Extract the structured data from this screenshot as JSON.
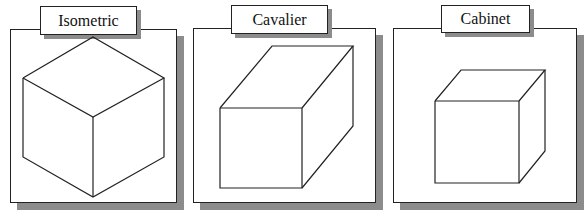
{
  "colors": {
    "shadow": "#8c8c8c",
    "stroke": "#222222",
    "background": "#ffffff"
  },
  "panels": [
    {
      "id": "isometric",
      "label": "Isometric",
      "box": {
        "x": 10,
        "y": 29,
        "w": 167,
        "h": 174
      },
      "labelBox": {
        "x": 40,
        "y": 6,
        "w": 97,
        "h": 29
      },
      "cube_shape": "isometric-cube",
      "vertices": {
        "top": [
          93,
          37
        ],
        "left": [
          23,
          78
        ],
        "right": [
          164,
          78
        ],
        "center": [
          93,
          117
        ],
        "bottom": [
          93,
          197
        ],
        "lower_left": [
          23,
          157
        ],
        "lower_right": [
          164,
          157
        ]
      }
    },
    {
      "id": "cavalier",
      "label": "Cavalier",
      "box": {
        "x": 193,
        "y": 28,
        "w": 183,
        "h": 175
      },
      "labelBox": {
        "x": 231,
        "y": 5,
        "w": 97,
        "h": 29
      },
      "cube_shape": "cavalier-box",
      "vertices": {
        "front_tl": [
          220,
          108
        ],
        "front_tr": [
          302,
          108
        ],
        "front_br": [
          302,
          188
        ],
        "front_bl": [
          220,
          188
        ],
        "back_tl": [
          272,
          46
        ],
        "back_tr": [
          353,
          46
        ],
        "back_br": [
          353,
          126
        ]
      }
    },
    {
      "id": "cabinet",
      "label": "Cabinet",
      "box": {
        "x": 393,
        "y": 28,
        "w": 184,
        "h": 175
      },
      "labelBox": {
        "x": 441,
        "y": 5,
        "w": 89,
        "h": 28
      },
      "cube_shape": "cabinet-cube",
      "vertices": {
        "front_tl": [
          435,
          101
        ],
        "front_tr": [
          519,
          101
        ],
        "front_br": [
          519,
          183
        ],
        "front_bl": [
          435,
          183
        ],
        "back_tl": [
          461,
          70
        ],
        "back_tr": [
          545,
          70
        ],
        "back_br": [
          545,
          151
        ]
      }
    }
  ]
}
